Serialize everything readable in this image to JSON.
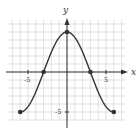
{
  "chart_data": {
    "type": "line",
    "title": "",
    "xlabel": "x",
    "ylabel": "y",
    "xlim": [
      -8,
      8
    ],
    "ylim": [
      -7,
      6.5
    ],
    "grid": true,
    "x_ticks": [
      {
        "value": -5,
        "label": "-5"
      },
      {
        "value": 5,
        "label": "5"
      }
    ],
    "y_ticks": [
      {
        "value": -5,
        "label": "-5"
      }
    ],
    "series": [
      {
        "name": "f(x)",
        "description": "smooth curve, y = 5cos(pi x / 6)",
        "points": [
          {
            "x": -6,
            "y": -5
          },
          {
            "x": -3,
            "y": 0
          },
          {
            "x": 0,
            "y": 5
          },
          {
            "x": 3,
            "y": 0
          },
          {
            "x": 6,
            "y": -5
          }
        ]
      }
    ],
    "marked_points": [
      [
        -6,
        -5
      ],
      [
        -3,
        0
      ],
      [
        0,
        5
      ],
      [
        3,
        0
      ],
      [
        6,
        -5
      ]
    ],
    "colors": {
      "curve": "#333333",
      "grid": "#cfcfcf",
      "axis": "#333333"
    }
  },
  "labels": {
    "x_axis": "x",
    "y_axis": "y",
    "x_tick_neg5": "-5",
    "x_tick_5": "5",
    "y_tick_neg5": "-5"
  }
}
